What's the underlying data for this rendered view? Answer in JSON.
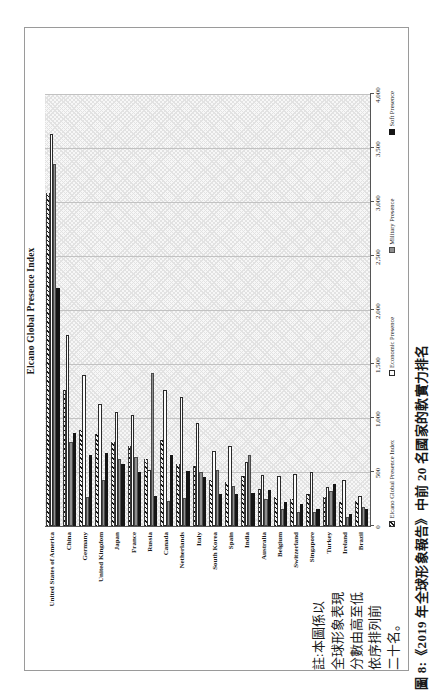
{
  "figure": {
    "caption": "圖 8:《2019 年全球形象報告》中前 20 名國家的軟實力排名",
    "note_lines": [
      "註:本圖係以",
      "全球形象表現",
      "分數由高至低",
      "依序排列前",
      "二十名。"
    ]
  },
  "chart_data": {
    "type": "bar",
    "orientation": "horizontal bars; whole figure rotated 90deg CCW on portrait page",
    "title": "Elcano Global Presence Index",
    "categories": [
      "United States of America",
      "China",
      "Germany",
      "United Kingdom",
      "Japan",
      "France",
      "Russia",
      "Canada",
      "Netherlands",
      "Italy",
      "South Korea",
      "Spain",
      "India",
      "Australia",
      "Belgium",
      "Switzerland",
      "Singapore",
      "Turkey",
      "Ireland",
      "Brazil"
    ],
    "series": [
      {
        "name": "Elcano Global Presence Index",
        "style": "diagonal-hatch",
        "color": "#f2f2f2",
        "values": [
          3080,
          1260,
          890,
          850,
          780,
          740,
          620,
          800,
          570,
          560,
          430,
          410,
          460,
          340,
          270,
          250,
          300,
          270,
          220,
          230
        ]
      },
      {
        "name": "Economic Presence",
        "style": "outline-white",
        "color": "#fdfdfd",
        "values": [
          3630,
          1770,
          1400,
          1130,
          1060,
          1030,
          520,
          1260,
          1190,
          950,
          690,
          740,
          590,
          470,
          460,
          480,
          500,
          360,
          430,
          280
        ]
      },
      {
        "name": "Military Presence",
        "style": "solid",
        "color": "#8f8f8f",
        "values": [
          3350,
          780,
          270,
          430,
          620,
          640,
          1420,
          230,
          260,
          500,
          520,
          370,
          660,
          250,
          160,
          130,
          130,
          320,
          85,
          175
        ]
      },
      {
        "name": "Soft Presence",
        "style": "solid",
        "color": "#161616",
        "values": [
          2200,
          860,
          660,
          680,
          570,
          500,
          280,
          660,
          510,
          450,
          300,
          300,
          310,
          330,
          220,
          200,
          160,
          390,
          110,
          160
        ]
      }
    ],
    "value_axis": {
      "min": 0,
      "max": 4000,
      "tick_interval": 500,
      "tick_labels": [
        "0",
        "500",
        "1,000",
        "1,500",
        "2,000",
        "2,500",
        "3,000",
        "3,500",
        "4,000"
      ]
    },
    "legend_position": "bottom",
    "grid": true,
    "note": "註:本圖係以全球形象表現分數由高至低依序排列前二十名。"
  }
}
